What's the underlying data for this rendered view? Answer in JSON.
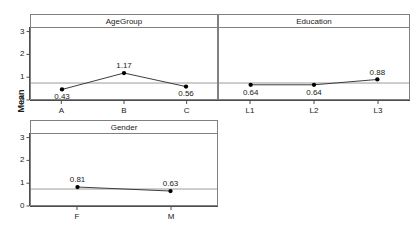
{
  "chart_data": {
    "type": "line",
    "title": "",
    "ylabel": "Mean",
    "xlabel": "",
    "ylim": [
      0,
      3.2
    ],
    "yticks": [
      0,
      1,
      2,
      3
    ],
    "ytick_labels": [
      "0",
      "1",
      "2",
      "3"
    ],
    "grid": false,
    "reference_line": 0.72,
    "marker": "filled-circle",
    "panels": [
      {
        "name": "AgeGroup",
        "categories": [
          "A",
          "B",
          "C"
        ],
        "values": [
          0.43,
          1.17,
          0.56
        ],
        "value_labels": [
          "0.43",
          "1.17",
          "0.56"
        ],
        "label_positions": [
          "below",
          "above",
          "below"
        ]
      },
      {
        "name": "Education",
        "categories": [
          "L1",
          "L2",
          "L3"
        ],
        "values": [
          0.64,
          0.64,
          0.88
        ],
        "value_labels": [
          "0.64",
          "0.64",
          "0.88"
        ],
        "label_positions": [
          "below",
          "below",
          "above"
        ]
      },
      {
        "name": "Gender",
        "categories": [
          "F",
          "M"
        ],
        "values": [
          0.81,
          0.63
        ],
        "value_labels": [
          "0.81",
          "0.63"
        ],
        "label_positions": [
          "above",
          "above"
        ]
      }
    ]
  },
  "colors": {
    "line": "#3a3a3a",
    "marker": "#000000",
    "axis": "#4d4d4d",
    "panel_border": "#808080",
    "reference_line": "#9a9a9a",
    "background": "#ffffff",
    "text": "#1a1a1a"
  }
}
